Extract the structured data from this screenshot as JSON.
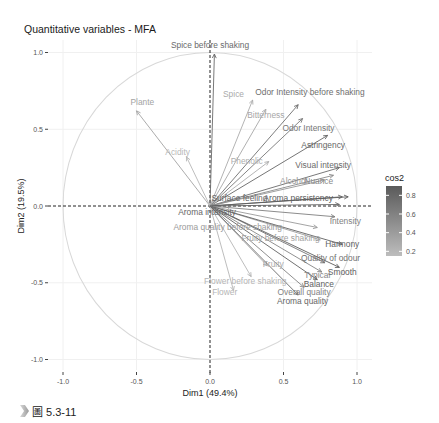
{
  "figure": {
    "caption": "圖 5.3-11",
    "caption_marker": "chevron-marker"
  },
  "chart_data": {
    "type": "scatter",
    "subtype": "variables-correlation-circle",
    "title": "Quantitative variables - MFA",
    "xlabel": "Dim1 (49.4%)",
    "ylabel": "Dim2 (19.5%)",
    "xlim": [
      -1.0,
      1.0
    ],
    "ylim": [
      -1.0,
      1.0
    ],
    "xticks": [
      "-1.0",
      "-0.5",
      "0.0",
      "0.5",
      "1.0"
    ],
    "yticks": [
      "1.0",
      "0.5",
      "0.0",
      "-0.5",
      "-1.0"
    ],
    "grid": true,
    "unit_circle": true,
    "legend": {
      "title": "cos2",
      "position": "right",
      "type": "gradient",
      "ticks": [
        "0.8",
        "0.6",
        "0.4",
        "0.2"
      ],
      "range": [
        0.15,
        0.9
      ],
      "color_low": "#bdbdbd",
      "color_high": "#5a5a5a"
    },
    "variables": [
      {
        "name": "Spice before shaking",
        "x": 0.03,
        "y": 0.99,
        "cos2": 0.78,
        "lx": 0.0,
        "ly": 1.05
      },
      {
        "name": "Plante",
        "x": -0.5,
        "y": 0.62,
        "cos2": 0.35,
        "lx": -0.46,
        "ly": 0.68
      },
      {
        "name": "Acidity",
        "x": -0.16,
        "y": 0.32,
        "cos2": 0.2,
        "lx": -0.22,
        "ly": 0.35
      },
      {
        "name": "Spice",
        "x": 0.29,
        "y": 0.69,
        "cos2": 0.3,
        "lx": 0.16,
        "ly": 0.73
      },
      {
        "name": "Odor Intensity before shaking",
        "x": 0.6,
        "y": 0.66,
        "cos2": 0.75,
        "lx": 0.68,
        "ly": 0.74
      },
      {
        "name": "Bitterness",
        "x": 0.38,
        "y": 0.63,
        "cos2": 0.32,
        "lx": 0.38,
        "ly": 0.59
      },
      {
        "name": "Odor Intensity",
        "x": 0.63,
        "y": 0.57,
        "cos2": 0.68,
        "lx": 0.67,
        "ly": 0.51
      },
      {
        "name": "Astringency",
        "x": 0.8,
        "y": 0.46,
        "cos2": 0.82,
        "lx": 0.77,
        "ly": 0.4
      },
      {
        "name": "Phenolic",
        "x": 0.4,
        "y": 0.29,
        "cos2": 0.28,
        "lx": 0.25,
        "ly": 0.29
      },
      {
        "name": "Visual intensity",
        "x": 0.88,
        "y": 0.25,
        "cos2": 0.78,
        "lx": 0.77,
        "ly": 0.27
      },
      {
        "name": "Alcohol",
        "x": 0.78,
        "y": 0.17,
        "cos2": 0.45,
        "lx": 0.57,
        "ly": 0.16
      },
      {
        "name": "Nuance",
        "x": 0.84,
        "y": 0.2,
        "cos2": 0.55,
        "lx": 0.74,
        "ly": 0.16
      },
      {
        "name": "Surface feeling",
        "x": 0.9,
        "y": 0.06,
        "cos2": 0.82,
        "lx": 0.2,
        "ly": 0.05
      },
      {
        "name": "Aroma persistency",
        "x": 0.94,
        "y": 0.06,
        "cos2": 0.88,
        "lx": 0.6,
        "ly": 0.05
      },
      {
        "name": "Aroma intensity",
        "x": 0.88,
        "y": 0.01,
        "cos2": 0.8,
        "lx": -0.02,
        "ly": -0.04
      },
      {
        "name": "Intensity",
        "x": 0.85,
        "y": -0.07,
        "cos2": 0.62,
        "lx": 0.92,
        "ly": -0.1
      },
      {
        "name": "Aroma quality before shaking",
        "x": 0.73,
        "y": -0.14,
        "cos2": 0.42,
        "lx": 0.12,
        "ly": -0.14
      },
      {
        "name": "Fruity before shaking",
        "x": 0.75,
        "y": -0.22,
        "cos2": 0.38,
        "lx": 0.48,
        "ly": -0.21
      },
      {
        "name": "Harmony",
        "x": 0.9,
        "y": -0.25,
        "cos2": 0.85,
        "lx": 0.9,
        "ly": -0.25
      },
      {
        "name": "Quality of odour",
        "x": 0.78,
        "y": -0.37,
        "cos2": 0.72,
        "lx": 0.82,
        "ly": -0.34
      },
      {
        "name": "Smooth",
        "x": 0.88,
        "y": -0.4,
        "cos2": 0.88,
        "lx": 0.9,
        "ly": -0.43
      },
      {
        "name": "Typical",
        "x": 0.76,
        "y": -0.43,
        "cos2": 0.58,
        "lx": 0.73,
        "ly": -0.45
      },
      {
        "name": "Fruity",
        "x": 0.39,
        "y": -0.39,
        "cos2": 0.3,
        "lx": 0.43,
        "ly": -0.38
      },
      {
        "name": "Balance",
        "x": 0.73,
        "y": -0.48,
        "cos2": 0.85,
        "lx": 0.74,
        "ly": -0.51
      },
      {
        "name": "Flower before shaking",
        "x": 0.28,
        "y": -0.46,
        "cos2": 0.22,
        "lx": 0.24,
        "ly": -0.49
      },
      {
        "name": "Flower",
        "x": 0.16,
        "y": -0.55,
        "cos2": 0.22,
        "lx": 0.1,
        "ly": -0.56
      },
      {
        "name": "Overall quality",
        "x": 0.64,
        "y": -0.53,
        "cos2": 0.6,
        "lx": 0.64,
        "ly": -0.56
      },
      {
        "name": "Aroma quality",
        "x": 0.6,
        "y": -0.58,
        "cos2": 0.8,
        "lx": 0.63,
        "ly": -0.62
      }
    ]
  }
}
